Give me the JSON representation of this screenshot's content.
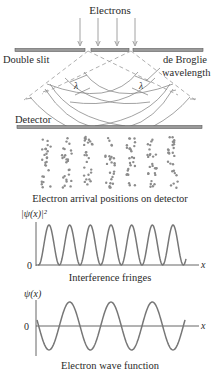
{
  "labels": {
    "electrons": "Electrons",
    "double_slit": "Double slit",
    "de_broglie_line1": "de Broglie",
    "de_broglie_line2": "wavelength",
    "lambda": "λ",
    "detector": "Detector",
    "arrival_caption": "Electron arrival positions on detector",
    "fringes_ylabel": "|ψ(x)|²",
    "fringes_zero": "0",
    "fringes_xlabel": "x",
    "fringes_caption": "Interference fringes",
    "wave_ylabel": "ψ(x)",
    "wave_zero": "0",
    "wave_xlabel": "x",
    "wave_caption": "Electron wave function"
  },
  "colors": {
    "line": "#8a8a8a",
    "text": "#2a2a2a",
    "dots": "#8c8c8c",
    "curve": "#777777"
  },
  "diagram": {
    "arrow_x": [
      80,
      98,
      117,
      135
    ],
    "slit_bars": [
      [
        15,
        85
      ],
      [
        91,
        129
      ],
      [
        133,
        203
      ]
    ],
    "slit_y": 50,
    "detector_y": 127,
    "detector_span": [
      17,
      202
    ],
    "dot_columns_x": [
      46,
      67,
      89,
      110,
      131,
      152,
      173
    ],
    "dot_rows_range": [
      137,
      188
    ]
  },
  "plots": {
    "fringes": {
      "peaks_x": [
        49,
        70,
        90,
        110,
        131,
        152,
        173
      ],
      "period_px": 20.7
    },
    "wave": {
      "peaks_x": [
        70,
        110,
        152
      ],
      "troughs_x": [
        49,
        90,
        131,
        172
      ]
    }
  }
}
